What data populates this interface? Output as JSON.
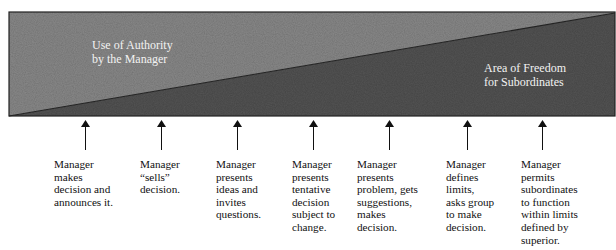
{
  "diagram": {
    "type": "authority-freedom-continuum",
    "colors": {
      "authority_area": "#8a8a8a",
      "freedom_area": "#555555",
      "outline": "#222222",
      "label_text": "#f2f2f2",
      "body_text": "#111111"
    },
    "regions": {
      "authority": {
        "label": "Use of Authority\nby the Manager"
      },
      "freedom": {
        "label": "Area of Freedom\nfor Subordinates"
      }
    },
    "behaviors": [
      {
        "text": "Manager\nmakes\ndecision and\nannounces it."
      },
      {
        "text": "Manager\n“sells”\ndecision."
      },
      {
        "text": "Manager\npresents\nideas and\ninvites\nquestions."
      },
      {
        "text": "Manager\npresents\ntentative\ndecision\nsubject to\nchange."
      },
      {
        "text": "Manager\npresents\nproblem, gets\nsuggestions,\nmakes\ndecision."
      },
      {
        "text": "Manager\ndefines\nlimits,\nasks group\nto make\ndecision."
      },
      {
        "text": "Manager\npermits\nsubordinates\nto function\nwithin limits\ndefined by\nsuperior."
      }
    ]
  }
}
